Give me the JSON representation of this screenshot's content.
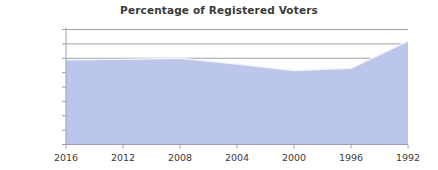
{
  "chart_data": {
    "type": "area",
    "title": "Percentage of Registered Voters",
    "xlabel": "",
    "ylabel": "",
    "x": [
      2016,
      2012,
      2008,
      2004,
      2000,
      1996,
      1992
    ],
    "categories": [
      "2016",
      "2012",
      "2008",
      "2004",
      "2000",
      "1996",
      "1992"
    ],
    "series": [
      {
        "name": "Percentage of Registered Voters",
        "values": [
          59.0,
          59.2,
          60.0,
          56.0,
          51.5,
          53.0,
          72.0
        ]
      }
    ],
    "values": [
      59.0,
      59.2,
      60.0,
      56.0,
      51.5,
      53.0,
      72.0
    ],
    "ylim": [
      0,
      80
    ],
    "ytick_values": [
      0,
      10,
      20,
      30,
      40,
      50,
      60,
      70,
      80
    ],
    "ytick_labels": [
      "0.00%",
      "10.00%",
      "20.00%",
      "30.00%",
      "40.00%",
      "50.00%",
      "60.00%",
      "70.00%",
      "80.00%"
    ],
    "xtick_labels": [
      "2016",
      "2012",
      "2008",
      "2004",
      "2000",
      "1996",
      "1992"
    ],
    "x_axis_reversed": true,
    "grid": true,
    "gridlines_at": [
      60,
      70,
      80
    ],
    "legend": false,
    "legend_position": "none",
    "area_fill_color": "#bcc5ea",
    "area_edge_color": "#f2f4fb",
    "gridline_color": "#8a8a8a",
    "axis_color": "#9aa0b4",
    "text_color": "#3a3a3a",
    "background_color": "#ffffff"
  }
}
